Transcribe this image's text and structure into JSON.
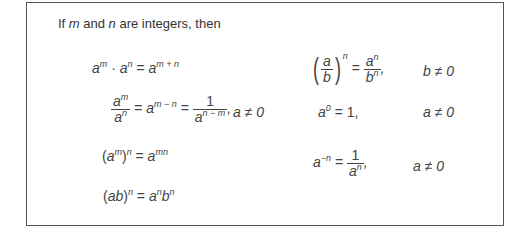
{
  "intro": {
    "prefix": "If ",
    "m": "m",
    "mid": " and ",
    "n": "n",
    "suffix": " are integers, then"
  },
  "rules": [
    {
      "name": "product-rule",
      "text": "a^m · a^n = a^(m + n)",
      "condition": ""
    },
    {
      "name": "quotient-rule",
      "text": "a^m / a^n = a^(m − n) = 1 / a^(n − m),",
      "condition": "a ≠ 0"
    },
    {
      "name": "power-of-power-rule",
      "text": "(a^m)^n = a^(mn)",
      "condition": ""
    },
    {
      "name": "power-of-product-rule",
      "text": "(ab)^n = a^n b^n",
      "condition": ""
    },
    {
      "name": "power-of-quotient-rule",
      "text": "(a/b)^n = a^n / b^n,",
      "condition": "b ≠ 0"
    },
    {
      "name": "zero-exponent-rule",
      "text": "a^0 = 1,",
      "condition": "a ≠ 0"
    },
    {
      "name": "negative-exponent-rule",
      "text": "a^(−n) = 1 / a^n,",
      "condition": "a ≠ 0"
    }
  ],
  "conds": {
    "b": "b ≠ 0",
    "a": "a ≠ 0"
  }
}
